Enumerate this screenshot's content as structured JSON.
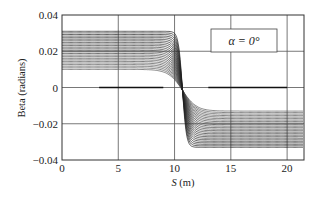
{
  "chart_data": {
    "type": "line",
    "title": "",
    "xlabel": "S (m)",
    "xlabel_var": "S",
    "xlabel_unit": "(m)",
    "ylabel": "Beta (radians)",
    "xlim": [
      0,
      21.5
    ],
    "ylim": [
      -0.04,
      0.04
    ],
    "xticks": [
      0,
      5,
      10,
      15,
      20
    ],
    "xtick_labels": [
      "0",
      "5",
      "10",
      "15",
      "20"
    ],
    "yticks": [
      0.04,
      0.02,
      0,
      -0.02,
      -0.04
    ],
    "ytick_labels": [
      "0.04",
      "0.02",
      "0",
      "−0.02",
      "−0.04"
    ],
    "grid": true,
    "legend": {
      "text": "α = 0°",
      "position": "upper right"
    },
    "annotation": "α = 0°",
    "series_description": "Family of ~25 curves: plateau at positive beta for S < ~9.5, steep transition crossing zero near S ≈ 10.7, plateau at negative beta for S > ~12",
    "series_count": 25,
    "upper_plateau_range": [
      0.01,
      0.031
    ],
    "lower_plateau_range": [
      -0.013,
      -0.033
    ],
    "transition_center_S": 10.7,
    "zero_line_segments": [
      [
        3.3,
        9.0
      ],
      [
        13.0,
        20.0
      ]
    ]
  }
}
